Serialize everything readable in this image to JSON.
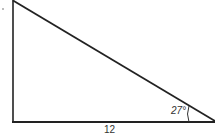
{
  "diagram": {
    "type": "right-triangle",
    "stroke_color": "#222222",
    "angle_label": "27°",
    "base_label": "12",
    "vertices": {
      "top_left": [
        13,
        1
      ],
      "bottom_left": [
        13,
        122
      ],
      "bottom_right": [
        214,
        122
      ]
    }
  }
}
